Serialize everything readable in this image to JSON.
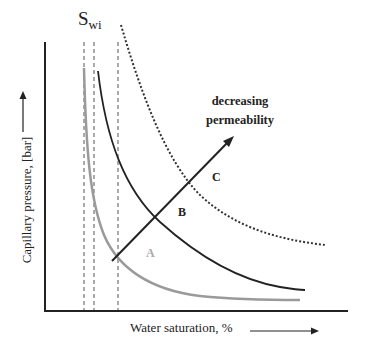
{
  "labels": {
    "swi_main": "S",
    "swi_sub": "wi",
    "trend_line1": "decreasing",
    "trend_line2": "permeability",
    "curve_a": "A",
    "curve_b": "B",
    "curve_c": "C",
    "y_axis": "Capillary pressure, [bar]",
    "x_axis": "Water saturation, %"
  },
  "colors": {
    "curve_a": "#9a9a9a",
    "curve_b": "#222222",
    "curve_c": "#333333",
    "axis": "#222222"
  },
  "curves": [
    {
      "name": "A",
      "style": "solid-gray",
      "description": "lowest capillary pressure curve, highest permeability"
    },
    {
      "name": "B",
      "style": "solid-black",
      "description": "intermediate capillary pressure curve"
    },
    {
      "name": "C",
      "style": "dotted-black",
      "description": "highest capillary pressure curve, lowest permeability"
    }
  ],
  "irreducible_saturation_lines": 3
}
